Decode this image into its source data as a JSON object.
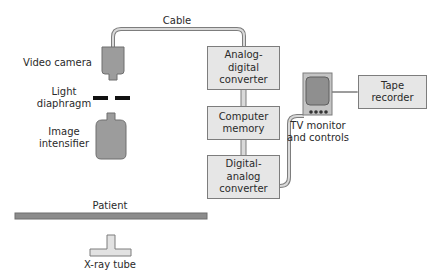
{
  "labels": {
    "cable": "Cable",
    "video_camera": "Video camera",
    "light_diaphragm_1": "Light",
    "light_diaphragm_2": "diaphragm",
    "image_intensifier_1": "Image",
    "image_intensifier_2": "intensifier",
    "patient": "Patient",
    "xray_tube": "X-ray tube",
    "tv_monitor_1": "TV monitor",
    "tv_monitor_2": "and controls"
  },
  "boxes": {
    "adc": [
      "Analog-",
      "digital",
      "converter"
    ],
    "memory": [
      "Computer",
      "memory"
    ],
    "dac": [
      "Digital-",
      "analog",
      "converter"
    ],
    "tape": [
      "Tape",
      "recorder"
    ]
  },
  "colors": {
    "component_fill": "#9c9c9c",
    "box_fill": "#e6e6e6",
    "outline": "#7d7d7d",
    "diaphragm": "#111111"
  }
}
